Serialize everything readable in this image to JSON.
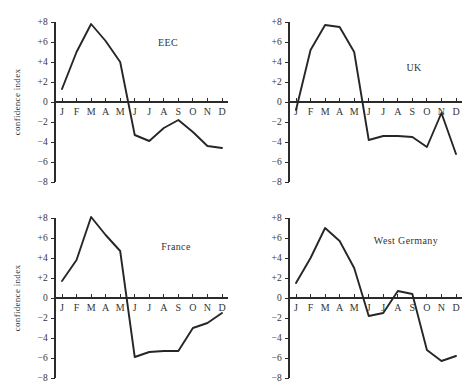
{
  "chart_data": {
    "type": "line",
    "title": "",
    "xlabel": "",
    "ylabel": "confidence index",
    "ylim": [
      -8,
      8
    ],
    "yticks": [
      8,
      6,
      4,
      2,
      0,
      -2,
      -4,
      -6,
      -8
    ],
    "ytick_labels": [
      "+8",
      "+6",
      "+4",
      "+2",
      "0",
      "−2",
      "−4",
      "−6",
      "−8"
    ],
    "categories": [
      "J",
      "F",
      "M",
      "A",
      "M",
      "J",
      "J",
      "A",
      "S",
      "O",
      "N",
      "D"
    ],
    "xlabel_full": [
      "January",
      "February",
      "March",
      "April",
      "May",
      "June",
      "July",
      "August",
      "September",
      "October",
      "November",
      "December"
    ],
    "grid": false,
    "legend": "none",
    "panels": [
      {
        "id": "eec",
        "name": "EEC",
        "values": [
          1.3,
          5.0,
          7.8,
          6.1,
          4.0,
          -3.3,
          -3.9,
          -2.6,
          -1.8,
          -3.0,
          -4.4,
          -4.6
        ]
      },
      {
        "id": "uk",
        "name": "UK",
        "values": [
          -0.8,
          5.2,
          7.7,
          7.5,
          5.0,
          -3.8,
          -3.4,
          -3.4,
          -3.5,
          -4.5,
          -1.1,
          -5.2
        ]
      },
      {
        "id": "france",
        "name": "France",
        "values": [
          1.7,
          3.8,
          8.1,
          6.3,
          4.7,
          -5.9,
          -5.4,
          -5.3,
          -5.3,
          -3.0,
          -2.5,
          -1.5
        ]
      },
      {
        "id": "west-germany",
        "name": "West Germany",
        "values": [
          1.5,
          4.0,
          7.0,
          5.7,
          3.0,
          -1.8,
          -1.5,
          0.7,
          0.4,
          -5.2,
          -6.3,
          -5.8
        ]
      }
    ]
  },
  "panel_title_positions": [
    {
      "x": 168,
      "y": 46
    },
    {
      "x": 180,
      "y": 71
    },
    {
      "x": 176,
      "y": 54
    },
    {
      "x": 172,
      "y": 48
    }
  ],
  "axis_label_shown": [
    true,
    false,
    true,
    false
  ]
}
